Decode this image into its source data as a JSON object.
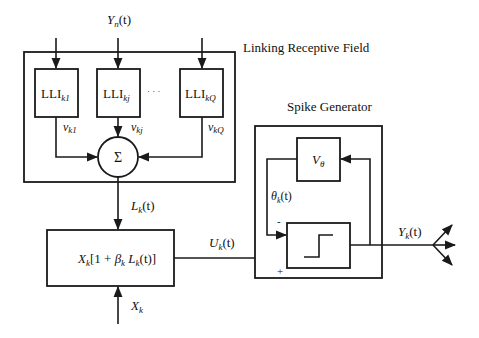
{
  "diagram": {
    "type": "block-diagram",
    "receptive_field": {
      "title": "Linking Receptive Field",
      "input_label": {
        "base": "Y",
        "sub": "n",
        "suffix": "(t)"
      },
      "units": [
        {
          "label": "LLI",
          "sub": "k1",
          "weight": {
            "base": "v",
            "sub": "k1"
          }
        },
        {
          "label": "LLI",
          "sub": "kj",
          "weight": {
            "base": "v",
            "sub": "kj"
          }
        },
        {
          "label": "LLI",
          "sub": "kQ",
          "weight": {
            "base": "v",
            "sub": "kQ"
          }
        }
      ],
      "ellipsis": "· · ·",
      "summation_symbol": "Σ"
    },
    "linking_output": {
      "base": "L",
      "sub": "k",
      "suffix": "(t)"
    },
    "modulation_block": {
      "expression_parts": [
        "X",
        "k",
        "[1 + ",
        "β",
        "k",
        " L",
        "k",
        "(t)]"
      ]
    },
    "feeding_input": {
      "base": "X",
      "sub": "k"
    },
    "internal_activity": {
      "base": "U",
      "sub": "k",
      "suffix": "(t)"
    },
    "spike_generator": {
      "title": "Spike Generator",
      "threshold_block": {
        "base": "V",
        "sub": "θ"
      },
      "threshold_signal": {
        "base": "θ",
        "sub": "k",
        "suffix": "(t)"
      },
      "minus_sign": "-",
      "plus_sign": "+"
    },
    "output": {
      "base": "Y",
      "sub": "k",
      "suffix": "(t)"
    }
  }
}
